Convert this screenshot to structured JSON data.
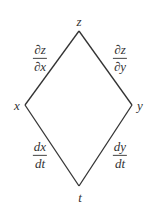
{
  "diagram": {
    "type": "tree-diagram",
    "line_color": "#333333",
    "nodes": {
      "top": {
        "label": "z",
        "x": 79,
        "y": 31,
        "label_x": 79,
        "label_y": 21
      },
      "left": {
        "label": "x",
        "x": 25,
        "y": 105,
        "label_x": 17,
        "label_y": 105
      },
      "right": {
        "label": "y",
        "x": 132,
        "y": 105,
        "label_x": 140,
        "label_y": 105
      },
      "bottom": {
        "label": "t",
        "x": 79,
        "y": 186,
        "label_x": 80,
        "label_y": 197
      }
    },
    "edges": [
      {
        "from": "top",
        "to": "left",
        "numerator": "∂z",
        "denominator": "∂x",
        "label_x": 40,
        "label_y": 58
      },
      {
        "from": "top",
        "to": "right",
        "numerator": "∂z",
        "denominator": "∂y",
        "label_x": 120,
        "label_y": 58
      },
      {
        "from": "left",
        "to": "bottom",
        "numerator": "dx",
        "denominator": "dt",
        "label_x": 40,
        "label_y": 155
      },
      {
        "from": "right",
        "to": "bottom",
        "numerator": "dy",
        "denominator": "dt",
        "label_x": 120,
        "label_y": 155
      }
    ]
  }
}
